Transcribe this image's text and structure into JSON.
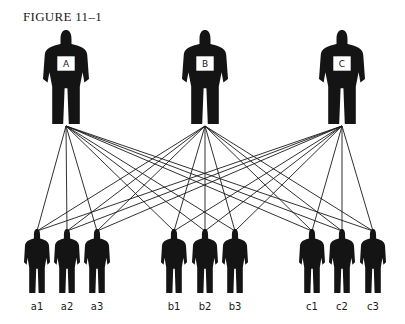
{
  "figure": {
    "title": "FIGURE 11–1",
    "colors": {
      "silhouette": "#141414",
      "line": "#1a1a1a",
      "background": "#ffffff"
    },
    "top_people": [
      {
        "id": "A",
        "label": "A"
      },
      {
        "id": "B",
        "label": "B"
      },
      {
        "id": "C",
        "label": "C"
      }
    ],
    "bottom_people": [
      {
        "id": "a1",
        "label": "a1"
      },
      {
        "id": "a2",
        "label": "a2"
      },
      {
        "id": "a3",
        "label": "a3"
      },
      {
        "id": "b1",
        "label": "b1"
      },
      {
        "id": "b2",
        "label": "b2"
      },
      {
        "id": "b3",
        "label": "b3"
      },
      {
        "id": "c1",
        "label": "c1"
      },
      {
        "id": "c2",
        "label": "c2"
      },
      {
        "id": "c3",
        "label": "c3"
      }
    ],
    "connections": "every top person is connected to every bottom person"
  }
}
